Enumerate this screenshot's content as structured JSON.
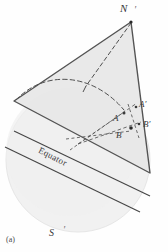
{
  "figure": {
    "caption": "(a)",
    "type": "geometric-sphere-projection-diagram",
    "labels": {
      "north_pole": "N",
      "south_pole": "S",
      "point_a": "A",
      "point_a_prime": "A′",
      "point_b": "B",
      "point_b_prime": "B′",
      "equator": "Equator",
      "axis_tick_north": "′",
      "axis_tick_south": "′"
    },
    "colors": {
      "background": "#fefefe",
      "sphere_fill": "#f0f0f0",
      "sphere_stroke": "#e2e2e2",
      "plane_fill": "#e9e9e9",
      "plane_stroke": "#4a4a4a",
      "dashed_stroke": "#555555",
      "equator_line": "#444444",
      "label_text": "#3a3a3a"
    },
    "geometry": {
      "sphere_center_x": 78,
      "sphere_center_y": 160,
      "sphere_radius": 72,
      "triangle_vertices": [
        {
          "name": "N",
          "x": 131,
          "y": 22
        },
        {
          "name": "left",
          "x": 14,
          "y": 101
        },
        {
          "name": "bottom",
          "x": 150,
          "y": 173
        }
      ],
      "projection_center": {
        "x": 78,
        "y": 144
      },
      "arc_label": "great-circle-arc"
    }
  }
}
